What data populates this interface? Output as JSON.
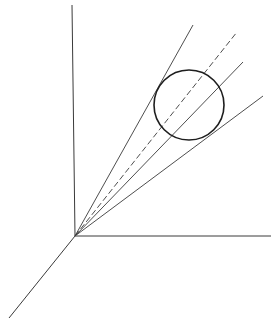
{
  "diagram": {
    "colors": {
      "background": "#ffffff",
      "stroke": "#3a3a3a",
      "circle": "#1e1e1e"
    },
    "origin": {
      "x": 75,
      "y": 236
    },
    "axes": [
      {
        "name": "vertical-axis",
        "x1": 75,
        "y1": 236,
        "x2": 72,
        "y2": 5
      },
      {
        "name": "horizontal-axis",
        "x1": 75,
        "y1": 236,
        "x2": 271,
        "y2": 236
      },
      {
        "name": "depth-axis",
        "x1": 75,
        "y1": 236,
        "x2": 9,
        "y2": 318
      }
    ],
    "rays": [
      {
        "name": "upper-tangent-line",
        "x2": 193,
        "y2": 25,
        "dashed": false
      },
      {
        "name": "center-dashed-line",
        "x2": 237,
        "y2": 32,
        "dashed": true
      },
      {
        "name": "inner-secant-line",
        "x2": 243,
        "y2": 62,
        "dashed": false
      },
      {
        "name": "lower-tangent-line",
        "x2": 263,
        "y2": 96,
        "dashed": false
      }
    ],
    "circle": {
      "cx": 189,
      "cy": 105,
      "r": 35
    }
  }
}
